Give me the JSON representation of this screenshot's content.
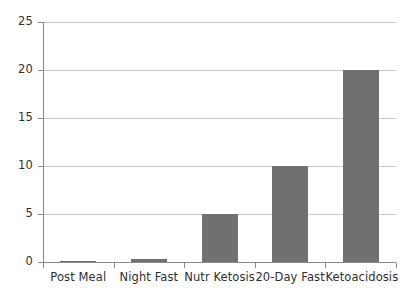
{
  "chart_data": {
    "type": "bar",
    "title": "",
    "subtitle": "",
    "xlabel": "",
    "ylabel": "",
    "categories": [
      "Post Meal",
      "Night Fast",
      "Nutr Ketosis",
      "20-Day Fast",
      "Ketoacidosis"
    ],
    "values": [
      0.1,
      0.3,
      5,
      10,
      20
    ],
    "ylim": [
      0,
      25
    ],
    "yticks": [
      "0",
      "5",
      "10",
      "15",
      "20",
      "25"
    ],
    "ytick_values": [
      0,
      5,
      10,
      15,
      20,
      25
    ],
    "grid": true,
    "legend": false,
    "legend_position": "none",
    "colors": {
      "bar": "#707070",
      "gridline": "#c9c9c9",
      "axis": "#8a8a8a",
      "text": "#2f2f2f",
      "background": "#ffffff"
    }
  }
}
